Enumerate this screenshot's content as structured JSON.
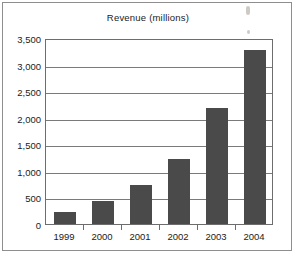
{
  "figure": {
    "name": "revenue-bar-chart"
  },
  "chart_data": {
    "type": "bar",
    "title": "Revenue (millions)",
    "xlabel": "",
    "ylabel": "",
    "categories": [
      "1999",
      "2000",
      "2001",
      "2002",
      "2003",
      "2004"
    ],
    "values": [
      230,
      440,
      740,
      1230,
      2190,
      3280
    ],
    "series": [
      {
        "name": "Revenue",
        "values": [
          230,
          440,
          740,
          1230,
          2190,
          3280
        ]
      }
    ],
    "ylim": [
      0,
      3500
    ],
    "yticks": [
      0,
      500,
      1000,
      1500,
      2000,
      2500,
      3000,
      3500
    ],
    "ytick_labels": [
      "0",
      "500",
      "1,000",
      "1,500",
      "2,000",
      "2,500",
      "3,000",
      "3,500"
    ],
    "grid": true,
    "grid_axis": "y",
    "legend": false,
    "legend_position": "none",
    "bar_color": "#4a4a4a",
    "gridline_color": "#7a7a7a",
    "axis_color": "#6d6d6d",
    "background_color": "#ffffff",
    "text_color": "#1b1b1b"
  }
}
